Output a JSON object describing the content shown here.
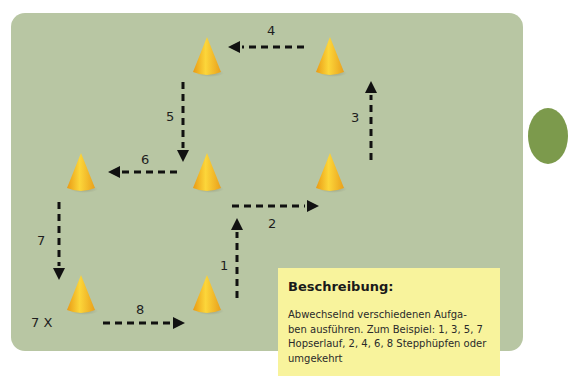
{
  "diagram": {
    "background_color": "#b8c6a3",
    "cone_color": "#f4b424",
    "arrow_color": "#111111",
    "repeat_label": "7 X",
    "segments": [
      {
        "number": "1",
        "direction": "up"
      },
      {
        "number": "2",
        "direction": "right"
      },
      {
        "number": "3",
        "direction": "up"
      },
      {
        "number": "4",
        "direction": "left"
      },
      {
        "number": "5",
        "direction": "down"
      },
      {
        "number": "6",
        "direction": "left"
      },
      {
        "number": "7",
        "direction": "down"
      },
      {
        "number": "8",
        "direction": "right"
      }
    ],
    "cones": [
      {
        "id": "cone-top-middle"
      },
      {
        "id": "cone-top-right"
      },
      {
        "id": "cone-middle-left"
      },
      {
        "id": "cone-middle-center"
      },
      {
        "id": "cone-middle-right"
      },
      {
        "id": "cone-bottom-left"
      },
      {
        "id": "cone-bottom-center"
      }
    ]
  },
  "description": {
    "title": "Beschreibung:",
    "body": "Abwechselnd verschiedenen Aufgaben ausführen. Zum Beispiel: 1, 3, 5, 7 Hopserlauf, 2, 4, 6, 8 Stepphüpfen oder umgekehrt",
    "lines": [
      "Abwechselnd verschiedenen Aufga-",
      "ben ausführen. Zum Beispiel: 1, 3, 5, 7",
      "Hopserlauf, 2, 4, 6, 8 Stepphüpfen oder",
      "umgekehrt"
    ],
    "background_color": "#f8f39c"
  }
}
